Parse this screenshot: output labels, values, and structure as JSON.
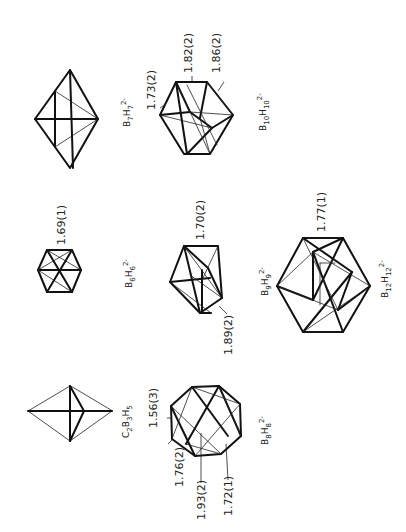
{
  "figure": {
    "orientation": "rotated-90-ccw",
    "structures": [
      {
        "id": "b7h7",
        "formula": {
          "parts": [
            [
              "B",
              "7"
            ],
            [
              "H",
              "7"
            ]
          ],
          "charge": "2-"
        },
        "bond_labels": []
      },
      {
        "id": "b10h10",
        "formula": {
          "parts": [
            [
              "B",
              "10"
            ],
            [
              "H",
              "10"
            ]
          ],
          "charge": "2-"
        },
        "bond_labels": [
          "1.73(2)",
          "1.82(2)",
          "1.86(2)"
        ]
      },
      {
        "id": "b6h6",
        "formula": {
          "parts": [
            [
              "B",
              "6"
            ],
            [
              "H",
              "6"
            ]
          ],
          "charge": "2-"
        },
        "bond_labels": [
          "1.69(1)"
        ]
      },
      {
        "id": "b9h9",
        "formula": {
          "parts": [
            [
              "B",
              "9"
            ],
            [
              "H",
              "9"
            ]
          ],
          "charge": "2-"
        },
        "bond_labels": [
          "1.70(2)",
          "1.89(2)"
        ]
      },
      {
        "id": "b12h12",
        "formula": {
          "parts": [
            [
              "B",
              "12"
            ],
            [
              "H",
              "12"
            ]
          ],
          "charge": "2-"
        },
        "bond_labels": [
          "1.77(1)"
        ]
      },
      {
        "id": "c2b3h5",
        "formula": {
          "parts": [
            [
              "C",
              "2"
            ],
            [
              "B",
              "3"
            ],
            [
              "H",
              "5"
            ]
          ],
          "charge": ""
        },
        "bond_labels": []
      },
      {
        "id": "b8h8",
        "formula": {
          "parts": [
            [
              "B",
              "8"
            ],
            [
              "H",
              "8"
            ]
          ],
          "charge": "2-"
        },
        "bond_labels": [
          "1.56(3)",
          "1.76(2)",
          "1.93(2)",
          "1.72(1)"
        ]
      }
    ]
  },
  "labels": {
    "b10_a": "1.73(2)",
    "b10_b": "1.82(2)",
    "b10_c": "1.86(2)",
    "b6_a": "1.69(1)",
    "b9_a": "1.70(2)",
    "b9_b": "1.89(2)",
    "b12_a": "1.77(1)",
    "b8_a": "1.56(3)",
    "b8_b": "1.76(2)",
    "b8_c": "1.93(2)",
    "b8_d": "1.72(1)"
  },
  "formulas": {
    "b7": {
      "e1": "B",
      "s1": "7",
      "e2": "H",
      "s2": "7",
      "charge": "2-"
    },
    "b10": {
      "e1": "B",
      "s1": "10",
      "e2": "H",
      "s2": "10",
      "charge": "2-"
    },
    "b6": {
      "e1": "B",
      "s1": "6",
      "e2": "H",
      "s2": "6",
      "charge": "2-"
    },
    "b9": {
      "e1": "B",
      "s1": "9",
      "e2": "H",
      "s2": "9",
      "charge": "2-"
    },
    "b12": {
      "e1": "B",
      "s1": "12",
      "e2": "H",
      "s2": "12",
      "charge": "2-"
    },
    "c2b3": {
      "e1": "C",
      "s1": "2",
      "e2": "B",
      "s2": "3",
      "e3": "H",
      "s3": "5"
    },
    "b8": {
      "e1": "B",
      "s1": "8",
      "e2": "H",
      "s2": "8",
      "charge": "2-"
    }
  },
  "colors": {
    "line": "#111111",
    "background": "#ffffff"
  }
}
